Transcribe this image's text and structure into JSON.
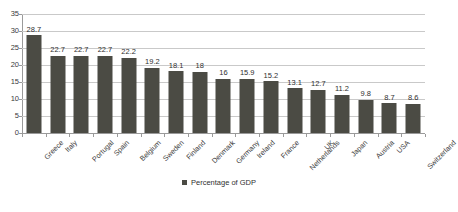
{
  "chart_data": {
    "type": "bar",
    "title": "",
    "subtitle": "",
    "xlabel": "",
    "ylabel": "",
    "ylim": [
      0,
      35
    ],
    "yticks": [
      0,
      5,
      10,
      15,
      20,
      25,
      30,
      35
    ],
    "grid": "horizontal",
    "legend_position": "bottom-center",
    "legend": [
      "Percentage of GDP"
    ],
    "series_name": "Percentage of GDP",
    "bar_color": "#4b4b44",
    "gridline_color": "#c9c9c9",
    "axis_color": "#9a9a9a",
    "categories": [
      "Greece",
      "Italy",
      "Portugal",
      "Spain",
      "Belgium",
      "Sweden",
      "Finland",
      "Denmark",
      "Germany",
      "Ireland",
      "France",
      "Netherlands",
      "UK",
      "Japan",
      "Austria",
      "USA",
      "Switzerland"
    ],
    "values": [
      28.7,
      22.7,
      22.7,
      22.7,
      22.2,
      19.2,
      18.1,
      18,
      16,
      15.9,
      15.2,
      13.1,
      12.7,
      11.2,
      9.8,
      8.7,
      8.6
    ],
    "value_labels": [
      "28.7",
      "22.7",
      "22.7",
      "22.7",
      "22.2",
      "19.2",
      "18.1",
      "18",
      "16",
      "15.9",
      "15.2",
      "13.1",
      "12.7",
      "11.2",
      "9.8",
      "8.7",
      "8.6"
    ],
    "ytick_labels": [
      "0",
      "5",
      "10",
      "15",
      "20",
      "25",
      "30",
      "35"
    ]
  }
}
